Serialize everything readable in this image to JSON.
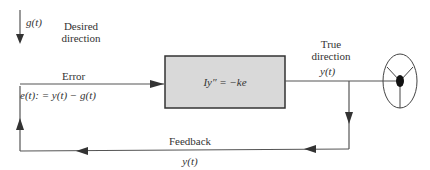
{
  "labels": {
    "input_signal": "g(t)",
    "desired_direction": [
      "Desired",
      "direction"
    ],
    "error_title": "Error",
    "error_equation": "e(t): = y(t) − g(t)",
    "block_equation": "Iy″ = −ke",
    "true_direction": [
      "True",
      "direction"
    ],
    "output_signal": "y(t)",
    "feedback_title": "Feedback",
    "feedback_signal": "y(t)"
  },
  "colors": {
    "line": "#555555",
    "block_fill": "#d9d9d9",
    "block_stroke": "#333333"
  }
}
